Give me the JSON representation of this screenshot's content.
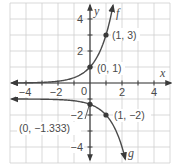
{
  "chart_data": {
    "type": "line",
    "title": "",
    "xlabel": "x",
    "ylabel": "y",
    "xlim": [
      -5,
      5
    ],
    "ylim": [
      -5,
      5
    ],
    "grid": true,
    "grid_step": 1,
    "x_ticks": [
      -4,
      -2,
      0,
      2,
      4
    ],
    "x_tick_labels": [
      "−4",
      "−2",
      "0",
      "2",
      "4"
    ],
    "y_ticks": [
      4,
      2,
      -2,
      -4
    ],
    "y_tick_labels": [
      "4",
      "2",
      "−2",
      "−4"
    ],
    "series": [
      {
        "name": "f",
        "equation": "f(x) = 3^x",
        "asymptote_y": 0,
        "points": [
          {
            "x": 0,
            "y": 1,
            "label": "(0, 1)"
          },
          {
            "x": 1,
            "y": 3,
            "label": "(1, 3)"
          }
        ]
      },
      {
        "name": "g",
        "equation": "g(x) = -(1/3)·3^x - 1",
        "asymptote_y": -1,
        "points": [
          {
            "x": 0,
            "y": -1.333,
            "label": "(0, −1.333)"
          },
          {
            "x": 1,
            "y": -2,
            "label": "(1, −2)"
          }
        ]
      }
    ],
    "legend": "none (curves labeled inline)"
  },
  "labels": {
    "x_axis": "x",
    "y_axis": "y",
    "f_name": "f",
    "g_name": "g",
    "x_ticks": [
      "−4",
      "−2",
      "0",
      "2",
      "4"
    ],
    "y_ticks": [
      "4",
      "2",
      "−2",
      "−4"
    ],
    "points": {
      "f0": "(0, 1)",
      "f1": "(1, 3)",
      "g0": "(0, −1.333)",
      "g1": "(1, −2)"
    }
  },
  "colors": {
    "grid": "#cfcfcf",
    "ink": "#4a4a4a",
    "background": "#ffffff"
  }
}
